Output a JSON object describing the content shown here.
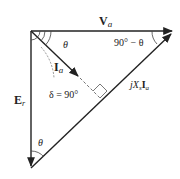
{
  "diagram": {
    "labels": {
      "va_main": "V",
      "va_sub": "a",
      "ia_main": "I",
      "ia_sub": "a",
      "er_main": "E",
      "er_sub": "r",
      "jxs_j": "j",
      "jxs_x": "X",
      "jxs_s": "s",
      "jxs_i": "I",
      "jxs_a": "a",
      "theta_top": "θ",
      "theta_bottom": "θ",
      "angle_right": "90° − θ",
      "delta": "δ = 90°"
    },
    "colors": {
      "line": "#222222",
      "dashed": "#666666",
      "background": "#ffffff"
    }
  }
}
